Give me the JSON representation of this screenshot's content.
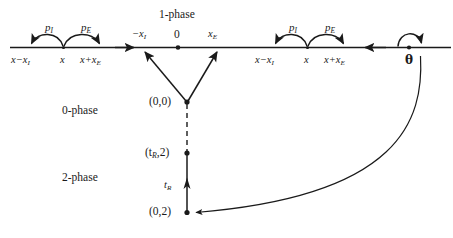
{
  "figure": {
    "type": "state-transition-diagram",
    "background_color": "#ffffff",
    "stroke_color": "#1a1a1a"
  },
  "phases": {
    "one_phase_label": "1-phase",
    "zero_phase_label": "0-phase",
    "two_phase_label": "2-phase"
  },
  "axis": {
    "left_group": {
      "rate_arc_left_label": "p",
      "rate_arc_left_sub": "I",
      "rate_arc_right_label": "p",
      "rate_arc_right_sub": "E",
      "tick_left": "x−x",
      "tick_left_sub": "I",
      "tick_center": "x",
      "tick_right": "x+x",
      "tick_right_sub": "E"
    },
    "right_group": {
      "rate_arc_left_label": "p",
      "rate_arc_left_sub": "I",
      "rate_arc_right_label": "p",
      "rate_arc_right_sub": "E",
      "tick_left": "x−x",
      "tick_left_sub": "I",
      "tick_center": "x",
      "tick_right": "x+x",
      "tick_right_sub": "E"
    },
    "center_ticks": {
      "minus_xI": "−x",
      "minus_xI_sub": "I",
      "origin": "0",
      "xE": "x",
      "xE_sub": "E"
    },
    "theta_label": "θ"
  },
  "nodes": {
    "origin_state": "(0,0)",
    "tR_two_state": "(t",
    "tR_two_state_sub": "R",
    "tR_two_state_tail": ",2)",
    "tR_label": "t",
    "tR_label_sub": "R",
    "zero_two_state": "(0,2)"
  }
}
